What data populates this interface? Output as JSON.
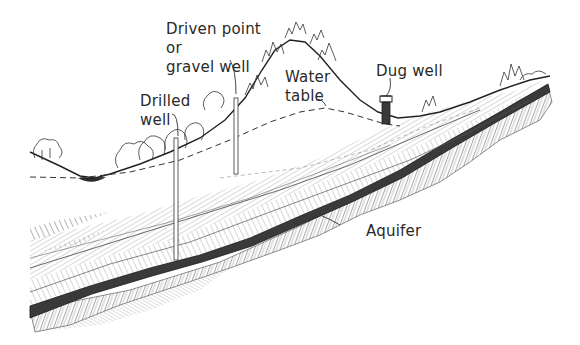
{
  "diagram": {
    "labels": {
      "driven_point": [
        "Driven point",
        "or",
        "gravel well"
      ],
      "drilled_well": [
        "Drilled",
        "well"
      ],
      "water_table": [
        "Water",
        "table"
      ],
      "dug_well": "Dug well",
      "aquifer": "Aquifer"
    },
    "elements": [
      {
        "name": "drilled-well",
        "type": "well",
        "x": 176
      },
      {
        "name": "driven-point-well",
        "type": "well",
        "x": 236
      },
      {
        "name": "dug-well",
        "type": "well",
        "x": 386
      },
      {
        "name": "water-table",
        "type": "dashed-line"
      },
      {
        "name": "aquifer-layer",
        "type": "dark-stratum"
      },
      {
        "name": "hill",
        "type": "terrain"
      },
      {
        "name": "pond",
        "type": "surface-water"
      }
    ],
    "colors": {
      "ink": "#2a2a2a",
      "aquifer": "#3a3a3a",
      "hatch": "#7a7a7a",
      "background": "#ffffff"
    }
  }
}
